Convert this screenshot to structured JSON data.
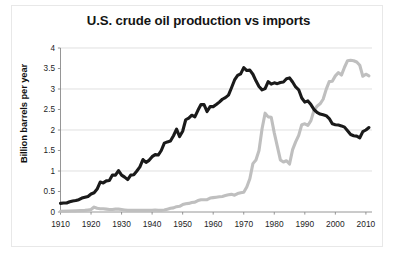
{
  "figure": {
    "title": "U.S. crude oil production vs imports",
    "y_axis_title": "Billion barrels per year",
    "background_color": "#ffffff",
    "frame_color": "#e8e8e8"
  },
  "chart_data": {
    "type": "line",
    "title": "U.S. crude oil production vs imports",
    "xlabel": "",
    "ylabel": "Billion barrels per year",
    "xlim": [
      1910,
      2012
    ],
    "ylim": [
      0,
      4
    ],
    "xticks": [
      1910,
      1920,
      1930,
      1940,
      1950,
      1960,
      1970,
      1980,
      1990,
      2000,
      2010
    ],
    "xtick_labels": [
      "1910",
      "1920",
      "1930",
      "1940",
      "1950",
      "1960",
      "1970",
      "1980",
      "1990",
      "2000",
      "2010"
    ],
    "yticks": [
      0,
      0.5,
      1,
      1.5,
      2,
      2.5,
      3,
      3.5,
      4
    ],
    "ytick_labels": [
      "0",
      "0.5",
      "1",
      "1.5",
      "2",
      "2.5",
      "3",
      "3.5",
      "4"
    ],
    "grid": true,
    "gridlines_at": [
      1,
      2,
      3,
      4
    ],
    "grid_color": "#d3d3d3",
    "legend": false,
    "series": [
      {
        "name": "production",
        "color": "#1a1a1a",
        "line_width": 3.1,
        "x": [
          1910,
          1911,
          1912,
          1913,
          1914,
          1915,
          1916,
          1917,
          1918,
          1919,
          1920,
          1921,
          1922,
          1923,
          1924,
          1925,
          1926,
          1927,
          1928,
          1929,
          1930,
          1931,
          1932,
          1933,
          1934,
          1935,
          1936,
          1937,
          1938,
          1939,
          1940,
          1941,
          1942,
          1943,
          1944,
          1945,
          1946,
          1947,
          1948,
          1949,
          1950,
          1951,
          1952,
          1953,
          1954,
          1955,
          1956,
          1957,
          1958,
          1959,
          1960,
          1961,
          1962,
          1963,
          1964,
          1965,
          1966,
          1967,
          1968,
          1969,
          1970,
          1971,
          1972,
          1973,
          1974,
          1975,
          1976,
          1977,
          1978,
          1979,
          1980,
          1981,
          1982,
          1983,
          1984,
          1985,
          1986,
          1987,
          1988,
          1989,
          1990,
          1991,
          1992,
          1993,
          1994,
          1995,
          1996,
          1997,
          1998,
          1999,
          2000,
          2001,
          2002,
          2003,
          2004,
          2005,
          2006,
          2007,
          2008,
          2009,
          2010,
          2011
        ],
        "y": [
          0.21,
          0.22,
          0.22,
          0.25,
          0.27,
          0.28,
          0.3,
          0.34,
          0.36,
          0.38,
          0.44,
          0.47,
          0.56,
          0.73,
          0.71,
          0.76,
          0.77,
          0.9,
          0.9,
          1.01,
          0.9,
          0.85,
          0.79,
          0.9,
          0.91,
          1.0,
          1.1,
          1.28,
          1.21,
          1.26,
          1.35,
          1.4,
          1.39,
          1.5,
          1.68,
          1.71,
          1.73,
          1.86,
          2.02,
          1.84,
          1.97,
          2.25,
          2.29,
          2.36,
          2.32,
          2.48,
          2.62,
          2.62,
          2.45,
          2.57,
          2.57,
          2.62,
          2.68,
          2.75,
          2.79,
          2.85,
          3.03,
          3.22,
          3.33,
          3.37,
          3.52,
          3.45,
          3.46,
          3.36,
          3.2,
          3.06,
          2.98,
          3.01,
          3.18,
          3.12,
          3.15,
          3.13,
          3.16,
          3.17,
          3.25,
          3.27,
          3.17,
          3.05,
          2.98,
          2.78,
          2.68,
          2.71,
          2.62,
          2.5,
          2.43,
          2.39,
          2.37,
          2.35,
          2.28,
          2.15,
          2.13,
          2.12,
          2.1,
          2.07,
          1.98,
          1.89,
          1.86,
          1.85,
          1.81,
          1.96,
          2.0,
          2.06
        ]
      },
      {
        "name": "imports",
        "color": "#bfbfbf",
        "line_width": 3.1,
        "x": [
          1910,
          1915,
          1918,
          1919,
          1920,
          1921,
          1922,
          1923,
          1924,
          1925,
          1926,
          1927,
          1928,
          1929,
          1930,
          1931,
          1932,
          1933,
          1934,
          1935,
          1936,
          1937,
          1938,
          1939,
          1940,
          1941,
          1942,
          1943,
          1944,
          1945,
          1946,
          1947,
          1948,
          1949,
          1950,
          1951,
          1952,
          1953,
          1954,
          1955,
          1956,
          1957,
          1958,
          1959,
          1960,
          1961,
          1962,
          1963,
          1964,
          1965,
          1966,
          1967,
          1968,
          1969,
          1970,
          1971,
          1972,
          1973,
          1974,
          1975,
          1976,
          1977,
          1978,
          1979,
          1980,
          1981,
          1982,
          1983,
          1984,
          1985,
          1986,
          1987,
          1988,
          1989,
          1990,
          1991,
          1992,
          1993,
          1994,
          1995,
          1996,
          1997,
          1998,
          1999,
          2000,
          2001,
          2002,
          2003,
          2004,
          2005,
          2006,
          2007,
          2008,
          2009,
          2010,
          2011
        ],
        "y": [
          0.02,
          0.03,
          0.04,
          0.05,
          0.06,
          0.12,
          0.09,
          0.08,
          0.08,
          0.07,
          0.06,
          0.06,
          0.07,
          0.07,
          0.06,
          0.05,
          0.04,
          0.04,
          0.04,
          0.04,
          0.04,
          0.04,
          0.04,
          0.04,
          0.04,
          0.05,
          0.04,
          0.04,
          0.05,
          0.07,
          0.09,
          0.1,
          0.13,
          0.14,
          0.18,
          0.2,
          0.21,
          0.23,
          0.24,
          0.28,
          0.3,
          0.3,
          0.3,
          0.34,
          0.35,
          0.36,
          0.37,
          0.38,
          0.4,
          0.42,
          0.43,
          0.41,
          0.45,
          0.47,
          0.48,
          0.61,
          0.81,
          1.18,
          1.27,
          1.5,
          2.03,
          2.41,
          2.32,
          2.31,
          1.93,
          1.6,
          1.27,
          1.22,
          1.25,
          1.17,
          1.52,
          1.71,
          1.87,
          2.13,
          2.15,
          2.11,
          2.23,
          2.48,
          2.58,
          2.64,
          2.75,
          2.99,
          3.18,
          3.19,
          3.32,
          3.4,
          3.34,
          3.53,
          3.69,
          3.7,
          3.69,
          3.66,
          3.58,
          3.31,
          3.36,
          3.32
        ]
      }
    ]
  }
}
